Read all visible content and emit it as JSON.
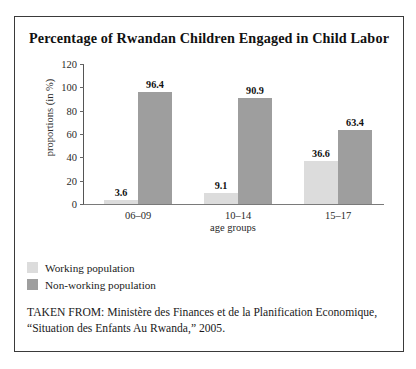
{
  "figure": {
    "title": "Percentage of Rwandan Children Engaged in Child Labor",
    "source_note": "TAKEN FROM: Ministère des Finances et de la Planification Economique, “Situation des Enfants Au Rwanda,” 2005.",
    "border_color": "#3a3a3a"
  },
  "chart_data": {
    "type": "bar",
    "title": "Percentage of Rwandan Children Engaged in Child Labor",
    "xlabel": "age groups",
    "ylabel": "proportions (in %)",
    "categories": [
      "06–09",
      "10–14",
      "15–17"
    ],
    "series": [
      {
        "name": "Working population",
        "color": "#dcdcdc",
        "values": [
          3.6,
          9.1,
          36.6
        ]
      },
      {
        "name": "Non-working population",
        "color": "#9e9e9e",
        "values": [
          96.4,
          90.9,
          63.4
        ]
      }
    ],
    "ylim": [
      0,
      120
    ],
    "yticks": [
      0,
      20,
      40,
      60,
      80,
      100,
      120
    ],
    "ytick_labels": [
      "0",
      "20",
      "40",
      "60",
      "80",
      "100",
      "120"
    ],
    "grid": false,
    "legend_position": "below-plot-left",
    "value_labels": true
  }
}
